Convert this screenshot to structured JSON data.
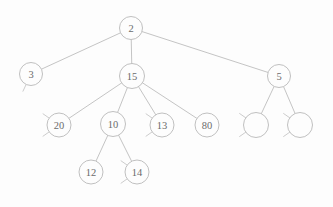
{
  "figure": {
    "kind": "tree-diagram",
    "title": "",
    "background_color": "#fdfdfd",
    "edge_color": "#bdbdbd",
    "node_fill_color": "#fdfdfd",
    "node_stroke_color": "#b9b9b9",
    "label_color": "#6b6b6b",
    "node_radius": 11.5
  },
  "nodes": [
    {
      "id": "n2",
      "label": "2",
      "x": 131,
      "y": 28,
      "r": 11.5,
      "empty": false
    },
    {
      "id": "n3",
      "label": "3",
      "x": 31,
      "y": 74,
      "r": 11.5,
      "empty": false
    },
    {
      "id": "n15",
      "label": "15",
      "x": 132,
      "y": 76,
      "r": 12.5,
      "empty": false
    },
    {
      "id": "n5",
      "label": "5",
      "x": 279,
      "y": 76,
      "r": 11.5,
      "empty": false
    },
    {
      "id": "n20",
      "label": "20",
      "x": 59,
      "y": 125,
      "r": 12.0,
      "empty": false
    },
    {
      "id": "n10",
      "label": "10",
      "x": 113,
      "y": 124,
      "r": 12.5,
      "empty": false
    },
    {
      "id": "n13",
      "label": "13",
      "x": 162,
      "y": 125,
      "r": 12.0,
      "empty": false
    },
    {
      "id": "n80",
      "label": "80",
      "x": 207,
      "y": 125,
      "r": 12.0,
      "empty": false
    },
    {
      "id": "ne1",
      "label": "",
      "x": 256,
      "y": 125,
      "r": 12.5,
      "empty": true
    },
    {
      "id": "ne2",
      "label": "",
      "x": 300,
      "y": 125,
      "r": 12.5,
      "empty": true
    },
    {
      "id": "n12",
      "label": "12",
      "x": 91,
      "y": 172,
      "r": 12.0,
      "empty": false
    },
    {
      "id": "n14",
      "label": "14",
      "x": 137,
      "y": 172,
      "r": 12.0,
      "empty": false
    }
  ],
  "edges": [
    {
      "from": "n2",
      "to": "n3"
    },
    {
      "from": "n2",
      "to": "n15"
    },
    {
      "from": "n2",
      "to": "n5"
    },
    {
      "from": "n15",
      "to": "n20"
    },
    {
      "from": "n15",
      "to": "n10"
    },
    {
      "from": "n15",
      "to": "n13"
    },
    {
      "from": "n15",
      "to": "n80"
    },
    {
      "from": "n5",
      "to": "ne1"
    },
    {
      "from": "n5",
      "to": "ne2"
    },
    {
      "from": "n10",
      "to": "n12"
    },
    {
      "from": "n10",
      "to": "n14"
    }
  ],
  "null_stubs": [
    {
      "node": "n3",
      "dirs": [
        205
      ]
    },
    {
      "node": "n20",
      "dirs": [
        235,
        305
      ]
    },
    {
      "node": "n13",
      "dirs": [
        235,
        305
      ]
    },
    {
      "node": "ne1",
      "dirs": [
        235,
        305
      ]
    },
    {
      "node": "ne2",
      "dirs": [
        235,
        305
      ]
    },
    {
      "node": "n14",
      "dirs": [
        235,
        305
      ]
    }
  ]
}
